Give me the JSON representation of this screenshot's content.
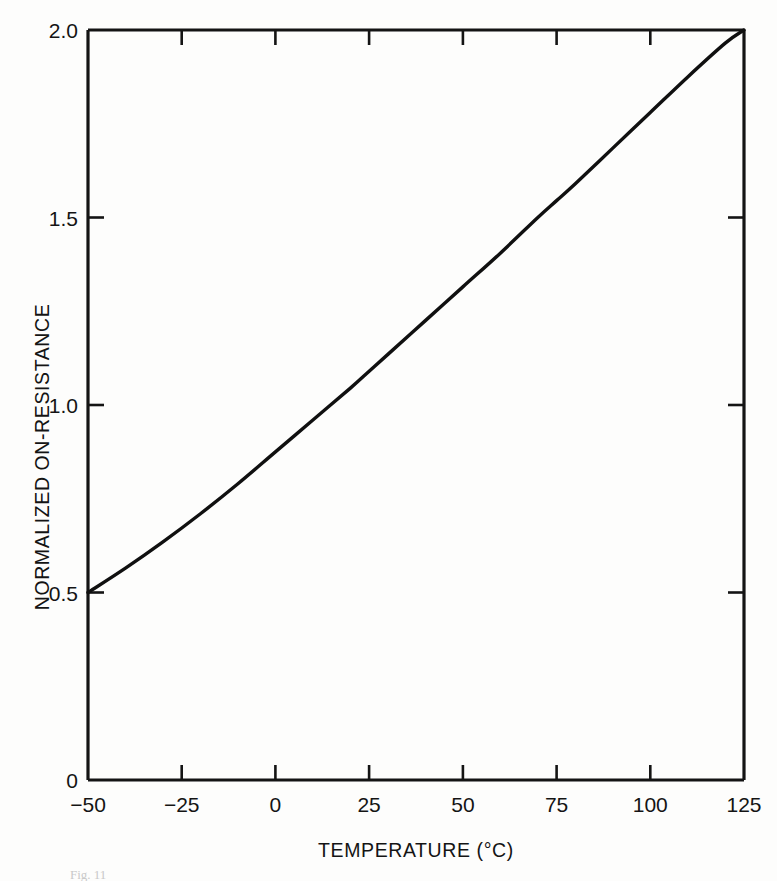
{
  "figure": {
    "background_color": "#fdfdfc",
    "ink_color": "#141414",
    "caption": "Fig. 11"
  },
  "chart_data": {
    "type": "line",
    "title": "",
    "subtitle": "",
    "xlabel": "TEMPERATURE (°C)",
    "ylabel": "NORMALIZED ON-RESISTANCE",
    "xlim": [
      -50,
      125
    ],
    "ylim": [
      0,
      2.0
    ],
    "grid": false,
    "legend": null,
    "legend_position": "none",
    "xticks": [
      -50,
      -25,
      0,
      25,
      50,
      75,
      100,
      125
    ],
    "xticklabels": [
      "−50",
      "−25",
      "0",
      "25",
      "50",
      "75",
      "100",
      "125"
    ],
    "yticks": [
      0,
      0.5,
      1.0,
      1.5,
      2.0
    ],
    "yticklabels": [
      "0",
      "0.5",
      "1.0",
      "1.5",
      "2.0"
    ],
    "axis_style": "box-frame-with-inward-ticks",
    "series": [
      {
        "name": "Normalized on-resistance vs temperature",
        "color": "#101010",
        "linewidth": 3.4,
        "x": [
          -50,
          -40,
          -30,
          -20,
          -10,
          0,
          10,
          20,
          25,
          30,
          40,
          50,
          60,
          70,
          75,
          80,
          90,
          100,
          110,
          120,
          125
        ],
        "y": [
          0.5,
          0.565,
          0.635,
          0.71,
          0.79,
          0.875,
          0.96,
          1.045,
          1.09,
          1.135,
          1.225,
          1.315,
          1.405,
          1.5,
          1.545,
          1.59,
          1.685,
          1.78,
          1.875,
          1.965,
          2.0
        ]
      }
    ],
    "annotations": []
  }
}
